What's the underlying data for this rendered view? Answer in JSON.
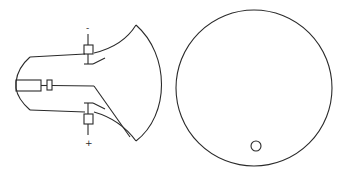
{
  "figure": {
    "side_view": {
      "terminal_top_label": "-",
      "terminal_bottom_label": "+"
    },
    "front_view": {
      "screen": "circular face",
      "spot": "small circle near bottom"
    }
  },
  "colors": {
    "line": "#2a2a2a",
    "background": "#ffffff"
  }
}
